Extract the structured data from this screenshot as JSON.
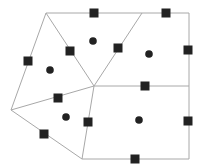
{
  "diagram": {
    "type": "polygon-partition",
    "colors": {
      "line": "#a8a8a8",
      "marker": "#222222",
      "background": "#ffffff"
    },
    "vertices": {
      "top_left": [
        46,
        13
      ],
      "top_mid": [
        142,
        13
      ],
      "top_right": [
        189,
        13
      ],
      "left": [
        11,
        110
      ],
      "center": [
        94,
        86
      ],
      "right_mid": [
        189,
        86
      ],
      "bottom_left": [
        82,
        159
      ],
      "bottom_right": [
        189,
        159
      ]
    },
    "edges": [
      [
        "top_left",
        "top_right"
      ],
      [
        "top_right",
        "bottom_right"
      ],
      [
        "bottom_right",
        "bottom_left"
      ],
      [
        "bottom_left",
        "left"
      ],
      [
        "left",
        "top_left"
      ],
      [
        "top_left",
        "center"
      ],
      [
        "top_mid",
        "center"
      ],
      [
        "center",
        "right_mid"
      ],
      [
        "center",
        "left"
      ],
      [
        "center",
        "bottom_left"
      ]
    ],
    "square_markers": [
      [
        94,
        13
      ],
      [
        166,
        13
      ],
      [
        70,
        51
      ],
      [
        118,
        48
      ],
      [
        28,
        61
      ],
      [
        188,
        50
      ],
      [
        145,
        86
      ],
      [
        58,
        98
      ],
      [
        88,
        122
      ],
      [
        188,
        121
      ],
      [
        44,
        134
      ],
      [
        135,
        159
      ]
    ],
    "circle_markers": [
      [
        93,
        41
      ],
      [
        149,
        54
      ],
      [
        50,
        70
      ],
      [
        66,
        117
      ],
      [
        139,
        120
      ]
    ]
  }
}
